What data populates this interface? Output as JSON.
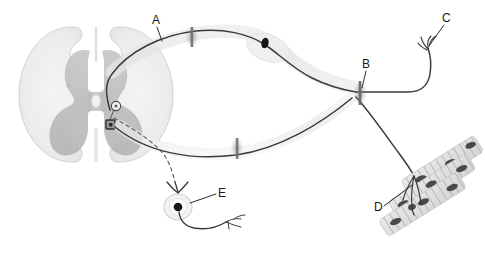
{
  "figure": {
    "background_color": "#ffffff",
    "ink_color": "#333333",
    "graymatter_color": "#b9b9b9",
    "whitematter_color": "#ededed",
    "nucleus_color": "#1a1a1a",
    "muscle_color": "#d9d9d9"
  },
  "labels": [
    {
      "id": "A",
      "text": "A",
      "x": 155,
      "y": 16,
      "refers_to": "myelinated-sensory-axon"
    },
    {
      "id": "B",
      "text": "B",
      "x": 363,
      "y": 59,
      "refers_to": "node-of-ranvier"
    },
    {
      "id": "C",
      "text": "C",
      "x": 443,
      "y": 13,
      "refers_to": "sensory-nerve-ending"
    },
    {
      "id": "D",
      "text": "D",
      "x": 374,
      "y": 202,
      "refers_to": "skeletal-muscle-fiber"
    },
    {
      "id": "E",
      "text": "E",
      "x": 219,
      "y": 188,
      "refers_to": "dorsal-root-ganglion-neuron"
    }
  ],
  "structures": {
    "spinal_cord": {
      "name": "spinal-cord-cross-section",
      "gray_matter": "butterfly-shaped gray matter",
      "white_matter": "surrounding white matter",
      "central_canal": true,
      "interneuron": "small circle in dorsal gray matter",
      "motor_neuron_soma": "dark square-shaped cell body in ventral gray matter"
    },
    "schwann_cell_nucleus": {
      "x": 265,
      "y": 43
    },
    "nodes_of_ranvier": [
      {
        "x": 192,
        "y": 37
      },
      {
        "x": 360,
        "y": 93
      },
      {
        "x": 237,
        "y": 148
      }
    ],
    "muscle": {
      "fiber_bands": 3,
      "striations": true,
      "nuclei": 10
    },
    "drg_neuron": {
      "soma_x": 178,
      "soma_y": 207,
      "pseudounipolar": true
    }
  }
}
